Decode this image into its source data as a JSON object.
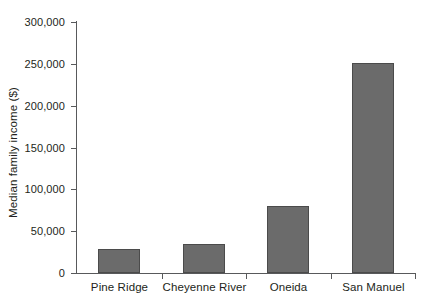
{
  "chart_data": {
    "type": "bar",
    "title": "",
    "xlabel": "",
    "ylabel": "Median family income ($)",
    "categories": [
      "Pine Ridge",
      "Cheyenne River",
      "Oneida",
      "San Manuel"
    ],
    "values": [
      29000,
      35000,
      80000,
      251000
    ],
    "ylim": [
      0,
      300000
    ],
    "yticks": [
      0,
      50000,
      100000,
      150000,
      200000,
      250000,
      300000
    ],
    "ytick_labels": [
      "0",
      "50,000",
      "100,000",
      "150,000",
      "200,000",
      "250,000",
      "300,000"
    ],
    "grid": false,
    "legend": null,
    "bar_color": "#6b6b6b",
    "bar_edge_color": "#4b4b4b",
    "axis_color": "#58595b",
    "text_color": "#231f20",
    "background_color": "#ffffff"
  }
}
